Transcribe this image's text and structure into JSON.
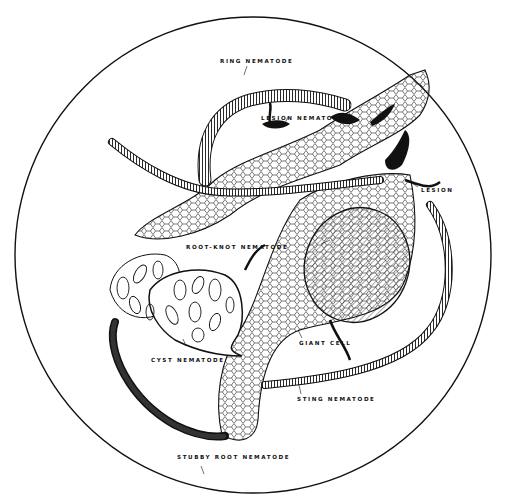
{
  "diagram": {
    "title": "",
    "labels": {
      "ring": "RING NEMATODE",
      "lesion_nematode": "LESION NEMATODE",
      "lesion": "LESION",
      "root_knot": "ROOT-KNOT NEMATODE",
      "cyst": "CYST NEMATODE",
      "giant_cell": "GIANT CELL",
      "sting": "STING NEMATODE",
      "stubby_root": "STUBBY ROOT NEMATODE"
    },
    "colors": {
      "ink": "#111111",
      "background": "#ffffff"
    }
  }
}
